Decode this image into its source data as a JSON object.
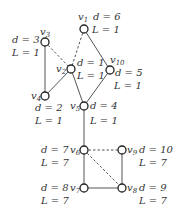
{
  "nodes": [
    {
      "id": "v1",
      "name": "v",
      "sub": "1",
      "x": 84,
      "y": 29,
      "d": "d = 6",
      "L": "L = 1"
    },
    {
      "id": "v2",
      "name": "v",
      "sub": "2",
      "x": 71,
      "y": 69,
      "d": "d = 1",
      "L": "L = 1"
    },
    {
      "id": "v3",
      "name": "v",
      "sub": "3",
      "x": 45,
      "y": 42,
      "d": "d = 3",
      "L": "L = 1"
    },
    {
      "id": "v4",
      "name": "v",
      "sub": "4",
      "x": 45,
      "y": 96,
      "d": "d = 2",
      "L": "L = 1"
    },
    {
      "id": "v5",
      "name": "v",
      "sub": "5",
      "x": 84,
      "y": 106,
      "d": "d = 4",
      "L": "L = 1"
    },
    {
      "id": "v6",
      "name": "v",
      "sub": "6",
      "x": 84,
      "y": 150,
      "d": "d = 7",
      "L": "L = 7"
    },
    {
      "id": "v7",
      "name": "v",
      "sub": "7",
      "x": 84,
      "y": 188,
      "d": "d = 8",
      "L": "L = 7"
    },
    {
      "id": "v8",
      "name": "v",
      "sub": "8",
      "x": 122,
      "y": 188,
      "d": "d = 9",
      "L": "L = 7"
    },
    {
      "id": "v9",
      "name": "v",
      "sub": "9",
      "x": 122,
      "y": 150,
      "d": "d = 10",
      "L": "L = 7"
    },
    {
      "id": "v10",
      "name": "v",
      "sub": "10",
      "x": 110,
      "y": 70,
      "d": "d = 5",
      "L": "L = 1"
    }
  ],
  "edges": [
    {
      "from": "v3",
      "to": "v4",
      "style": "solid"
    },
    {
      "from": "v4",
      "to": "v2",
      "style": "solid"
    },
    {
      "from": "v2",
      "to": "v5",
      "style": "solid"
    },
    {
      "from": "v5",
      "to": "v10",
      "style": "solid"
    },
    {
      "from": "v10",
      "to": "v1",
      "style": "solid"
    },
    {
      "from": "v3",
      "to": "v2",
      "style": "dashed"
    },
    {
      "from": "v1",
      "to": "v2",
      "style": "dashed"
    },
    {
      "from": "v5",
      "to": "v6",
      "style": "solid"
    },
    {
      "from": "v6",
      "to": "v7",
      "style": "solid"
    },
    {
      "from": "v7",
      "to": "v8",
      "style": "solid"
    },
    {
      "from": "v8",
      "to": "v9",
      "style": "solid"
    },
    {
      "from": "v6",
      "to": "v9",
      "style": "dashed"
    },
    {
      "from": "v6",
      "to": "v8",
      "style": "dashed"
    }
  ]
}
